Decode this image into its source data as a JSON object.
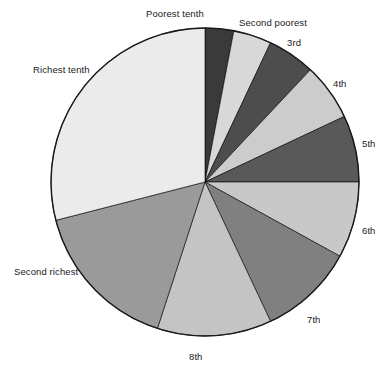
{
  "chart_data": {
    "type": "pie",
    "title": "",
    "subtitle": "",
    "xlabel": "",
    "ylabel": "",
    "legend_position": "none",
    "grid": false,
    "start_angle_deg": 0,
    "direction": "clockwise",
    "categories": [
      "Poorest tenth",
      "Second poorest",
      "3rd",
      "4th",
      "5th",
      "6th",
      "7th",
      "8th",
      "Second richest",
      "Richest tenth"
    ],
    "values": [
      3,
      4,
      5,
      6,
      7,
      8,
      10,
      12,
      16,
      29
    ],
    "colors": [
      "#3a3a3a",
      "#d8d8d8",
      "#4d4d4d",
      "#cccccc",
      "#595959",
      "#c8c8c8",
      "#808080",
      "#c4c4c4",
      "#9a9a9a",
      "#ebebeb"
    ],
    "slices": [
      {
        "label": "Poorest tenth",
        "value": 3,
        "color": "#3a3a3a",
        "label_x": 204,
        "label_y": 14,
        "label_anchor": "end"
      },
      {
        "label": "Second poorest",
        "value": 4,
        "color": "#d8d8d8",
        "label_x": 239,
        "label_y": 23,
        "label_anchor": "start"
      },
      {
        "label": "3rd",
        "value": 5,
        "color": "#4d4d4d",
        "label_x": 287,
        "label_y": 43,
        "label_anchor": "start"
      },
      {
        "label": "4th",
        "value": 6,
        "color": "#cccccc",
        "label_x": 333,
        "label_y": 84,
        "label_anchor": "start"
      },
      {
        "label": "5th",
        "value": 7,
        "color": "#595959",
        "label_x": 362,
        "label_y": 144,
        "label_anchor": "start"
      },
      {
        "label": "6th",
        "value": 8,
        "color": "#c8c8c8",
        "label_x": 362,
        "label_y": 231,
        "label_anchor": "start"
      },
      {
        "label": "7th",
        "value": 10,
        "color": "#808080",
        "label_x": 307,
        "label_y": 320,
        "label_anchor": "start"
      },
      {
        "label": "8th",
        "value": 12,
        "color": "#c4c4c4",
        "label_x": 196,
        "label_y": 357,
        "label_anchor": "middle"
      },
      {
        "label": "Second richest",
        "value": 16,
        "color": "#9a9a9a",
        "label_x": 14,
        "label_y": 272,
        "label_anchor": "start"
      },
      {
        "label": "Richest tenth",
        "value": 29,
        "color": "#ebebeb",
        "label_x": 33,
        "label_y": 70,
        "label_anchor": "start"
      }
    ],
    "geometry": {
      "center_x": 205,
      "center_y": 182,
      "radius": 154
    }
  }
}
